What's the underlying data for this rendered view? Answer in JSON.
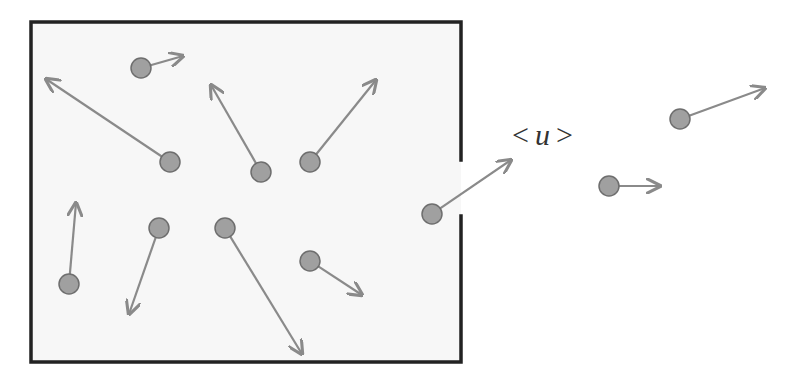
{
  "diagram": {
    "type": "effusion-through-orifice",
    "label": {
      "open": "<",
      "variable": "u",
      "close": ">"
    },
    "colors": {
      "wall": "#222222",
      "particle_fill": "#a0a0a0",
      "particle_stroke": "#6e6e6e",
      "arrow": "#8a8a8a",
      "box_fill": "#f7f7f7"
    },
    "container": {
      "left": 31,
      "top": 22,
      "right": 461,
      "bottom": 362,
      "opening": {
        "side": "right",
        "y_start": 160,
        "y_end": 216
      }
    },
    "particles": [
      {
        "id": "p1",
        "x": 141,
        "y": 68,
        "vx": 183,
        "vy": 56,
        "location": "inside"
      },
      {
        "id": "p2",
        "x": 170,
        "y": 162,
        "vx": 46,
        "vy": 79,
        "location": "inside"
      },
      {
        "id": "p3",
        "x": 261,
        "y": 172,
        "vx": 211,
        "vy": 85,
        "location": "inside"
      },
      {
        "id": "p4",
        "x": 310,
        "y": 162,
        "vx": 376,
        "vy": 80,
        "location": "inside"
      },
      {
        "id": "p5",
        "x": 69,
        "y": 284,
        "vx": 76,
        "vy": 203,
        "location": "inside"
      },
      {
        "id": "p6",
        "x": 159,
        "y": 228,
        "vx": 129,
        "vy": 314,
        "location": "inside"
      },
      {
        "id": "p7",
        "x": 225,
        "y": 228,
        "vx": 302,
        "vy": 354,
        "location": "inside"
      },
      {
        "id": "p8",
        "x": 310,
        "y": 261,
        "vx": 362,
        "vy": 295,
        "location": "inside"
      },
      {
        "id": "p9",
        "x": 432,
        "y": 214,
        "vx": 511,
        "vy": 160,
        "location": "exiting"
      },
      {
        "id": "p10",
        "x": 680,
        "y": 119,
        "vx": 765,
        "vy": 88,
        "location": "outside"
      },
      {
        "id": "p11",
        "x": 609,
        "y": 186,
        "vx": 660,
        "vy": 186,
        "location": "outside"
      }
    ]
  }
}
